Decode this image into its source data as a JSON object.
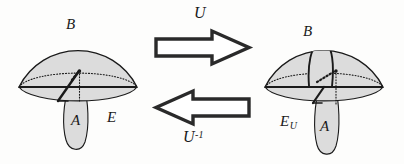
{
  "figure": {
    "background_color": "#fdfdfc",
    "ink_color": "#1a1a1a",
    "dome_fill": "#dcdcdc",
    "teardrop_fill": "#dcdcdc"
  },
  "left_diagram": {
    "name": "original space E",
    "dome_label": "B",
    "teardrop_label": "A",
    "space_label": "E"
  },
  "right_diagram": {
    "name": "transformed space E sub U",
    "dome_label": "B",
    "teardrop_label": "A",
    "space_label": "E",
    "space_label_sub": "U"
  },
  "arrows": {
    "forward": {
      "label": "U",
      "direction": "right",
      "style": "hollow-block-arrow"
    },
    "backward": {
      "label": "U",
      "label_sup": "-1",
      "direction": "left",
      "style": "hollow-block-arrow"
    }
  }
}
